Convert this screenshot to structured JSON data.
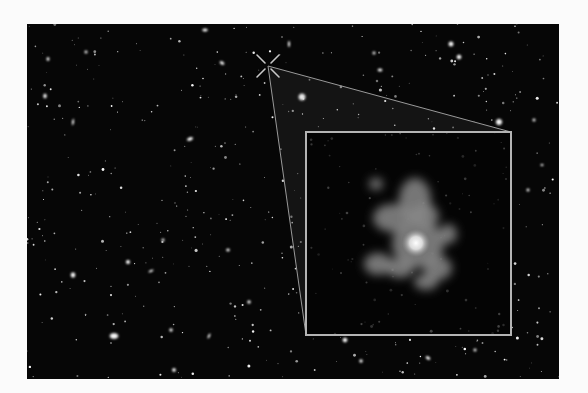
{
  "image": {
    "width": 588,
    "height": 393,
    "page_background": "#fbfbfb",
    "field": {
      "x": 27,
      "y": 24,
      "width": 532,
      "height": 355,
      "color": "#060606"
    }
  },
  "marker": {
    "icon": "x-crosshair-icon",
    "cx": 268,
    "cy": 66,
    "arm": 11,
    "color": "#c8c8c8"
  },
  "zoom_lines": {
    "color": "#9a9a9a",
    "wedge_fill": "rgba(120,120,120,0.12)",
    "from": {
      "x": 268,
      "y": 66
    },
    "to_top_right": {
      "x": 511,
      "y": 132
    },
    "to_bottom_left": {
      "x": 306,
      "y": 335
    }
  },
  "inset": {
    "x": 306,
    "y": 132,
    "width": 205,
    "height": 203,
    "border_color": "#b4b4b4",
    "background": "#040404",
    "galaxy": {
      "core": {
        "cx": 416,
        "cy": 243,
        "r": 14
      },
      "blobs": [
        {
          "cx": 415,
          "cy": 200,
          "rx": 16,
          "ry": 22
        },
        {
          "cx": 393,
          "cy": 218,
          "rx": 20,
          "ry": 14
        },
        {
          "cx": 425,
          "cy": 216,
          "rx": 14,
          "ry": 12
        },
        {
          "cx": 418,
          "cy": 244,
          "rx": 26,
          "ry": 24
        },
        {
          "cx": 448,
          "cy": 234,
          "rx": 9,
          "ry": 10
        },
        {
          "cx": 378,
          "cy": 264,
          "rx": 14,
          "ry": 11
        },
        {
          "cx": 400,
          "cy": 268,
          "rx": 14,
          "ry": 10
        },
        {
          "cx": 438,
          "cy": 268,
          "rx": 14,
          "ry": 12
        },
        {
          "cx": 426,
          "cy": 282,
          "rx": 12,
          "ry": 8
        },
        {
          "cx": 376,
          "cy": 184,
          "rx": 7,
          "ry": 6
        }
      ]
    }
  },
  "bright_objects": [
    {
      "cx": 302,
      "cy": 97,
      "rx": 4.5,
      "ry": 4.5,
      "rot": 0
    },
    {
      "cx": 114,
      "cy": 336,
      "rx": 5.5,
      "ry": 3.8,
      "rot": 0
    },
    {
      "cx": 499,
      "cy": 122,
      "rx": 4,
      "ry": 4,
      "rot": 0
    },
    {
      "cx": 451,
      "cy": 44,
      "rx": 3.2,
      "ry": 3.2,
      "rot": 0
    },
    {
      "cx": 459,
      "cy": 57,
      "rx": 3,
      "ry": 3,
      "rot": 0
    },
    {
      "cx": 73,
      "cy": 275,
      "rx": 3,
      "ry": 3.4,
      "rot": 0
    },
    {
      "cx": 345,
      "cy": 340,
      "rx": 3,
      "ry": 3,
      "rot": 0
    },
    {
      "cx": 128,
      "cy": 262,
      "rx": 2.6,
      "ry": 2.6,
      "rot": 0
    },
    {
      "cx": 222,
      "cy": 63,
      "rx": 3.2,
      "ry": 2,
      "rot": 30
    },
    {
      "cx": 45,
      "cy": 96,
      "rx": 2.2,
      "ry": 3,
      "rot": 0
    },
    {
      "cx": 73,
      "cy": 122,
      "rx": 1.3,
      "ry": 4,
      "rot": 10
    },
    {
      "cx": 190,
      "cy": 139,
      "rx": 4,
      "ry": 2.2,
      "rot": -20
    },
    {
      "cx": 205,
      "cy": 30,
      "rx": 3.5,
      "ry": 2,
      "rot": 0
    },
    {
      "cx": 171,
      "cy": 330,
      "rx": 2.2,
      "ry": 2.2,
      "rot": 0
    },
    {
      "cx": 249,
      "cy": 302,
      "rx": 2.2,
      "ry": 2.2,
      "rot": 0
    },
    {
      "cx": 174,
      "cy": 370,
      "rx": 2.4,
      "ry": 2.4,
      "rot": 0
    },
    {
      "cx": 428,
      "cy": 358,
      "rx": 3.2,
      "ry": 2,
      "rot": 30
    },
    {
      "cx": 361,
      "cy": 361,
      "rx": 2.2,
      "ry": 2.2,
      "rot": 0
    },
    {
      "cx": 534,
      "cy": 120,
      "rx": 2,
      "ry": 2,
      "rot": 0
    },
    {
      "cx": 528,
      "cy": 190,
      "rx": 2,
      "ry": 2,
      "rot": 0
    },
    {
      "cx": 380,
      "cy": 70,
      "rx": 3,
      "ry": 2,
      "rot": 0
    },
    {
      "cx": 374,
      "cy": 53,
      "rx": 2,
      "ry": 2,
      "rot": 0
    },
    {
      "cx": 163,
      "cy": 240,
      "rx": 2,
      "ry": 2,
      "rot": 0
    },
    {
      "cx": 209,
      "cy": 336,
      "rx": 1.4,
      "ry": 3.4,
      "rot": 25
    },
    {
      "cx": 151,
      "cy": 271,
      "rx": 3.4,
      "ry": 1.4,
      "rot": -25
    },
    {
      "cx": 48,
      "cy": 59,
      "rx": 2,
      "ry": 2.4,
      "rot": 0
    },
    {
      "cx": 86,
      "cy": 52,
      "rx": 2,
      "ry": 2,
      "rot": 0
    },
    {
      "cx": 289,
      "cy": 44,
      "rx": 1.2,
      "ry": 4,
      "rot": 0
    },
    {
      "cx": 475,
      "cy": 350,
      "rx": 2,
      "ry": 2,
      "rot": 0
    },
    {
      "cx": 542,
      "cy": 165,
      "rx": 2,
      "ry": 1.5,
      "rot": 0
    },
    {
      "cx": 228,
      "cy": 250,
      "rx": 2.3,
      "ry": 2,
      "rot": 0
    }
  ],
  "faint_star_count": 520,
  "faint_star_seed": 7
}
